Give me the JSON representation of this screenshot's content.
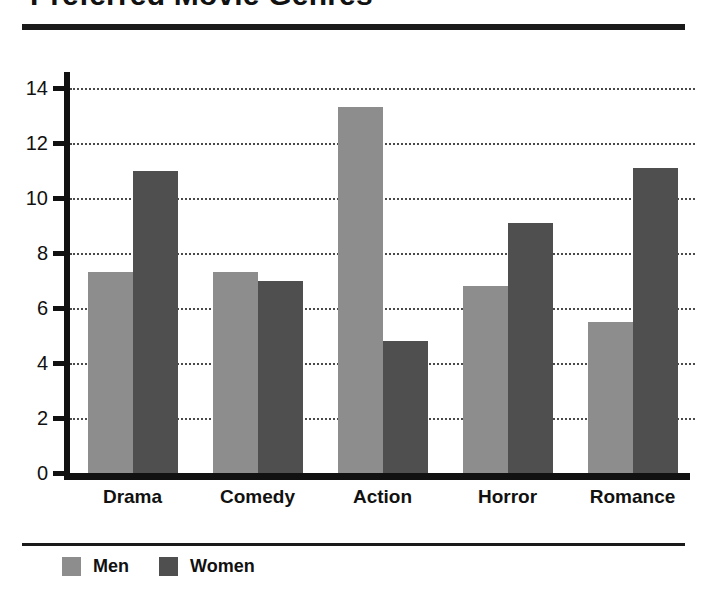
{
  "chart_data": {
    "type": "bar",
    "title": "Preferred Movie Genres",
    "xlabel": "",
    "ylabel": "",
    "categories": [
      "Drama",
      "Comedy",
      "Action",
      "Horror",
      "Romance"
    ],
    "series": [
      {
        "name": "Men",
        "color": "#8d8d8d",
        "values": [
          7.3,
          7.3,
          13.3,
          6.8,
          5.5
        ]
      },
      {
        "name": "Women",
        "color": "#4f4f4f",
        "values": [
          11.0,
          7.0,
          4.8,
          9.1,
          11.1
        ]
      }
    ],
    "ylim": [
      0,
      14
    ],
    "ytick_labels": [
      "0",
      "2",
      "4",
      "6",
      "8",
      "10",
      "12",
      "14"
    ],
    "ytick_values": [
      0,
      2,
      4,
      6,
      8,
      10,
      12,
      14
    ],
    "grid": true,
    "grid_axis": "y",
    "grid_style": "dotted",
    "legend_position": "bottom-left",
    "legend": [
      "Men",
      "Women"
    ]
  }
}
